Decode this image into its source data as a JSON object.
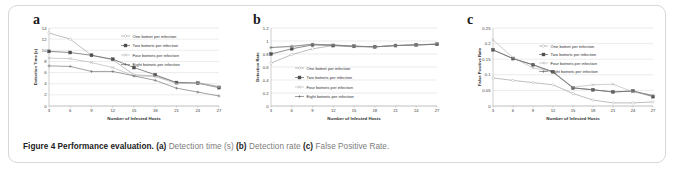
{
  "figure": {
    "caption_bold_1": "Figure 4 Performance evaluation.",
    "caption_a_label": "(a)",
    "caption_a_text": "Detection time (s)",
    "caption_b_label": "(b)",
    "caption_b_text": "Detection rate",
    "caption_c_label": "(c)",
    "caption_c_text": "False Positive Rate.",
    "border_color": "#d8d8d8"
  },
  "panels": {
    "a": {
      "letter": "a"
    },
    "b": {
      "letter": "b"
    },
    "c": {
      "letter": "c"
    }
  },
  "colors": {
    "series_one": "#9a9a9a",
    "series_two": "#4f4f4f",
    "series_four": "#b5b5b5",
    "series_eight": "#6e6e6e",
    "grid": "#d4d4d4",
    "axis": "#9d9d9d",
    "text": "#3a3a3a"
  },
  "chart_data": [
    {
      "type": "line",
      "panel": "a",
      "title": "",
      "xlabel": "Number of Infected Hosts",
      "ylabel": "Detection Time (s)",
      "x": [
        3,
        6,
        9,
        12,
        15,
        18,
        21,
        24,
        27
      ],
      "xticks": [
        "3",
        "6",
        "9",
        "12",
        "15",
        "18",
        "21",
        "24",
        "27"
      ],
      "yticks": [
        "0",
        "2",
        "4",
        "6",
        "8",
        "10",
        "12",
        "14"
      ],
      "ylim": [
        0,
        14
      ],
      "xlim": [
        3,
        27
      ],
      "grid": true,
      "legend_position": "top-right",
      "series": [
        {
          "name": "One botnet per infection",
          "values": [
            13.1,
            12.0,
            9.1,
            8.3,
            5.6,
            5.4,
            4.2,
            4.2,
            3.5
          ]
        },
        {
          "name": "Two botnets per infection",
          "values": [
            9.8,
            9.6,
            9.1,
            8.4,
            6.9,
            5.6,
            4.2,
            4.1,
            3.3
          ]
        },
        {
          "name": "Four botnets per infection",
          "values": [
            8.6,
            8.5,
            7.8,
            6.9,
            5.4,
            5.3,
            4.0,
            4.1,
            3.4
          ]
        },
        {
          "name": "Eight botnets per infection",
          "values": [
            7.2,
            7.1,
            6.2,
            6.2,
            5.4,
            4.6,
            3.2,
            2.5,
            1.8
          ]
        }
      ]
    },
    {
      "type": "line",
      "panel": "b",
      "title": "",
      "xlabel": "Number of Infected Hosts",
      "ylabel": "Detection Rate",
      "x": [
        3,
        6,
        9,
        12,
        15,
        18,
        21,
        24,
        27
      ],
      "xticks": [
        "3",
        "6",
        "9",
        "12",
        "15",
        "18",
        "21",
        "24",
        "27"
      ],
      "yticks": [
        "0",
        "0.2",
        "0.4",
        "0.6",
        "0.8",
        "1",
        "1.2"
      ],
      "ylim": [
        0,
        1.2
      ],
      "xlim": [
        3,
        27
      ],
      "grid": true,
      "legend_position": "middle-left",
      "series": [
        {
          "name": "One botnet per infection",
          "values": [
            0.66,
            0.79,
            0.88,
            0.93,
            0.91,
            0.91,
            0.93,
            0.94,
            0.95
          ]
        },
        {
          "name": "Two botnets per infection",
          "values": [
            0.8,
            0.88,
            0.94,
            0.93,
            0.92,
            0.91,
            0.93,
            0.94,
            0.95
          ]
        },
        {
          "name": "Four botnets per infection",
          "values": [
            0.9,
            0.91,
            0.95,
            0.94,
            0.92,
            0.91,
            0.93,
            0.94,
            0.96
          ]
        },
        {
          "name": "Eight botnets per infection",
          "values": [
            0.9,
            0.92,
            0.95,
            0.94,
            0.92,
            0.91,
            0.93,
            0.94,
            0.95
          ]
        }
      ]
    },
    {
      "type": "line",
      "panel": "c",
      "title": "",
      "xlabel": "Number of Infected Hosts",
      "ylabel": "False Positive Rate",
      "x": [
        3,
        6,
        9,
        12,
        15,
        18,
        21,
        24,
        27
      ],
      "xticks": [
        "3",
        "6",
        "9",
        "12",
        "15",
        "18",
        "21",
        "24",
        "27"
      ],
      "yticks": [
        "0",
        "0.05",
        "0.1",
        "0.15",
        "0.2",
        "0.25"
      ],
      "ylim": [
        0,
        0.25
      ],
      "xlim": [
        3,
        27
      ],
      "grid": true,
      "legend_position": "top-right",
      "series": [
        {
          "name": "One botnet per infection",
          "values": [
            0.09,
            0.082,
            0.075,
            0.068,
            0.04,
            0.019,
            0.01,
            0.01,
            0.013
          ]
        },
        {
          "name": "Two botnets per infection",
          "values": [
            0.18,
            0.152,
            0.132,
            0.11,
            0.058,
            0.052,
            0.045,
            0.048,
            0.03
          ]
        },
        {
          "name": "Four botnets per infection",
          "values": [
            0.212,
            0.155,
            0.122,
            0.11,
            0.06,
            0.068,
            0.07,
            0.045,
            0.035
          ]
        },
        {
          "name": "Eight botnets per infection",
          "values": [
            0.18,
            0.152,
            0.132,
            0.108,
            0.058,
            0.052,
            0.045,
            0.048,
            0.033
          ]
        }
      ]
    }
  ]
}
